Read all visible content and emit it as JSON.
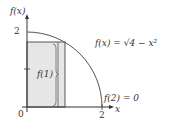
{
  "diagram": {
    "y_axis_label": "f(x)",
    "x_axis_label": "x",
    "origin_label": "0",
    "y_tick_label": "2",
    "x_tick_label": "2",
    "function_label": "f(x) = √4 − x²",
    "rect_label": "f(1)",
    "endpoint_label": "f(2) = 0",
    "colors": {
      "axis": "#333333",
      "curve": "#555555",
      "rect_fill": "#e6e6e6",
      "rect_stroke": "#555555"
    }
  }
}
